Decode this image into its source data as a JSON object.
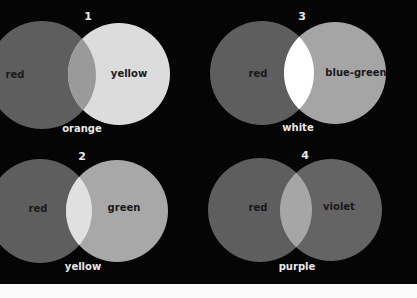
{
  "figure": {
    "background": "#050505",
    "panels": [
      {
        "number": "1",
        "left_label": "red",
        "right_label": "yellow",
        "mix_label": "orange",
        "left_color": "#5e5e5e",
        "right_color": "#dcdcdc",
        "mix_color": "#9a9a9a"
      },
      {
        "number": "2",
        "left_label": "red",
        "right_label": "green",
        "mix_label": "yellow",
        "left_color": "#5e5e5e",
        "right_color": "#a8a8a8",
        "mix_color": "#e0e0e0"
      },
      {
        "number": "3",
        "left_label": "red",
        "right_label": "blue-green",
        "mix_label": "white",
        "left_color": "#5e5e5e",
        "right_color": "#a5a5a5",
        "mix_color": "#ffffff"
      },
      {
        "number": "4",
        "left_label": "red",
        "right_label": "violet",
        "mix_label": "purple",
        "left_color": "#5e5e5e",
        "right_color": "#646464",
        "mix_color": "#a6a6a6"
      }
    ]
  }
}
